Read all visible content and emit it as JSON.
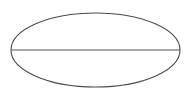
{
  "figure": {
    "name": "ellipse-with-major-axis",
    "canvas": {
      "width": 191,
      "height": 99,
      "background_color": "#ffffff"
    },
    "shapes": {
      "ellipse": {
        "label": "ellipse-outline",
        "center_x": 95.5,
        "center_y": 50,
        "radius_x": 84.5,
        "radius_y": 37,
        "stroke_color": "#4a4a4a",
        "stroke_width": 1.1,
        "fill": "none"
      },
      "major_axis": {
        "label": "major-axis-line",
        "x1": 11,
        "y1": 50,
        "x2": 180,
        "y2": 50,
        "stroke_color": "#555555",
        "stroke_width": 1.1
      }
    },
    "annotations": []
  }
}
